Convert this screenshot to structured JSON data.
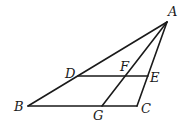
{
  "diagram": {
    "type": "geometry-triangle",
    "stroke_color": "#1a1a1a",
    "background": "#ffffff",
    "points": {
      "A": {
        "label": "A",
        "x": 167,
        "y": 22,
        "lx": 168,
        "ly": 16
      },
      "B": {
        "label": "B",
        "x": 28,
        "y": 106,
        "lx": 14,
        "ly": 111
      },
      "C": {
        "label": "C",
        "x": 137,
        "y": 106,
        "lx": 141,
        "ly": 113
      },
      "D": {
        "label": "D",
        "x": 78,
        "y": 76,
        "lx": 65,
        "ly": 78
      },
      "E": {
        "label": "E",
        "x": 148,
        "y": 76,
        "lx": 150,
        "ly": 82
      },
      "F": {
        "label": "F",
        "x": 124,
        "y": 76,
        "lx": 120,
        "ly": 71
      },
      "G": {
        "label": "G",
        "x": 102,
        "y": 106,
        "lx": 93,
        "ly": 120
      }
    },
    "segments": [
      {
        "name": "AB",
        "from": "A",
        "to": "B"
      },
      {
        "name": "BC",
        "from": "B",
        "to": "C"
      },
      {
        "name": "CA",
        "from": "C",
        "to": "A"
      },
      {
        "name": "DE",
        "from": "D",
        "to": "E"
      },
      {
        "name": "AG",
        "from": "A",
        "to": "G"
      }
    ]
  }
}
